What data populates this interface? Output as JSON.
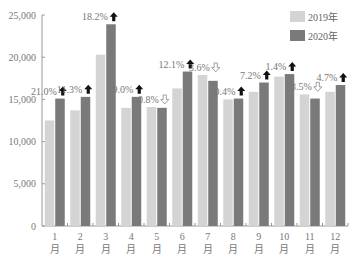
{
  "chart_data": {
    "type": "bar",
    "title": "",
    "xlabel": "",
    "ylabel": "",
    "ylim": [
      0,
      25000
    ],
    "yticks": [
      "0",
      "5,000",
      "10,000",
      "15,000",
      "20,000",
      "25,000"
    ],
    "categories": [
      "1\n月",
      "2\n月",
      "3\n月",
      "4\n月",
      "5\n月",
      "6\n月",
      "7\n月",
      "8\n月",
      "9\n月",
      "10\n月",
      "11\n月",
      "12\n月"
    ],
    "category_numbers": [
      "1",
      "2",
      "3",
      "4",
      "5",
      "6",
      "7",
      "8",
      "9",
      "10",
      "11",
      "12"
    ],
    "category_unit": "月",
    "series": [
      {
        "name": "2019年",
        "color": "#d4d4d4",
        "values": [
          12500,
          13700,
          20300,
          14000,
          14100,
          16300,
          17900,
          15000,
          15900,
          17700,
          15600,
          15900
        ]
      },
      {
        "name": "2020年",
        "color": "#7a7a7a",
        "values": [
          15100,
          15300,
          23900,
          15300,
          14000,
          18300,
          17200,
          15100,
          17000,
          18000,
          15100,
          16700
        ]
      }
    ],
    "annotations": [
      {
        "month": 1,
        "text": "21.0%",
        "direction": "up"
      },
      {
        "month": 2,
        "text": "11.3%",
        "direction": "up"
      },
      {
        "month": 3,
        "text": "18.2%",
        "direction": "up"
      },
      {
        "month": 4,
        "text": "9.0%",
        "direction": "up"
      },
      {
        "month": 5,
        "text": "0.8%",
        "direction": "down"
      },
      {
        "month": 6,
        "text": "12.1%",
        "direction": "up"
      },
      {
        "month": 7,
        "text": "3.6%",
        "direction": "down"
      },
      {
        "month": 8,
        "text": "0.4%",
        "direction": "up"
      },
      {
        "month": 9,
        "text": "7.2%",
        "direction": "up"
      },
      {
        "month": 10,
        "text": "1.4%",
        "direction": "up"
      },
      {
        "month": 11,
        "text": "3.5%",
        "direction": "down"
      },
      {
        "month": 12,
        "text": "4.7%",
        "direction": "up"
      }
    ],
    "legend": {
      "position": "top-right",
      "entries": [
        "2019年",
        "2020年"
      ]
    },
    "grid": false
  }
}
